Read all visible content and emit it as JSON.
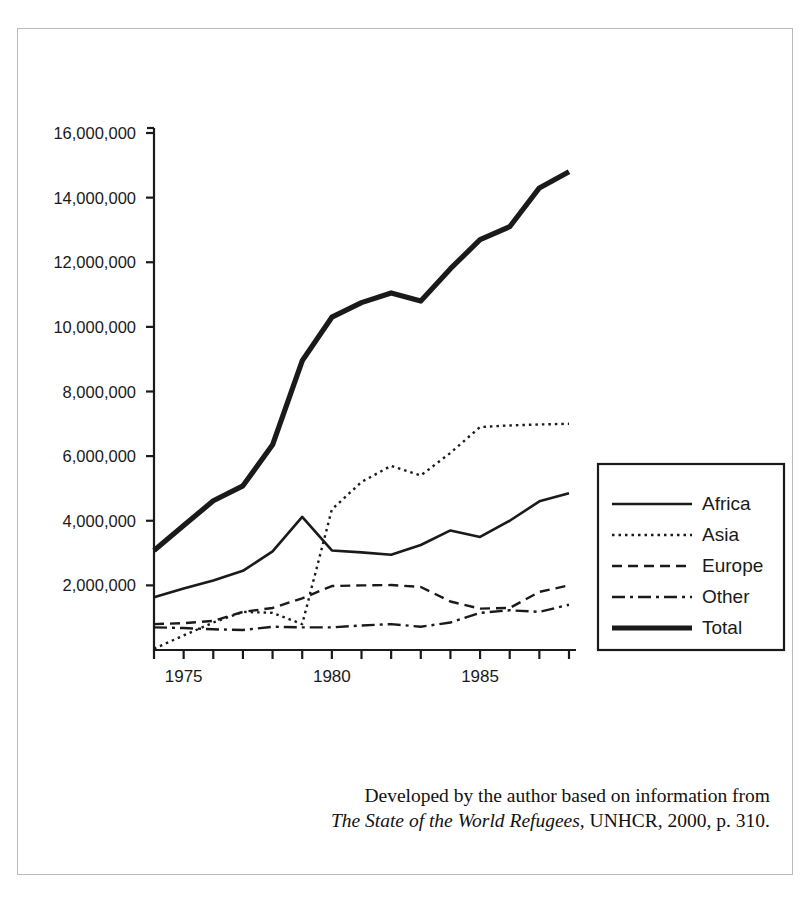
{
  "figure": {
    "caption_line1": "Developed by the author based on information from",
    "caption_title": "The State of the World Refugees",
    "caption_line2_rest": ", UNHCR, 2000, p. 310."
  },
  "legend": {
    "items": [
      {
        "label": "Africa",
        "style": "solid-thin"
      },
      {
        "label": "Asia",
        "style": "dotted"
      },
      {
        "label": "Europe",
        "style": "dashed"
      },
      {
        "label": "Other",
        "style": "dash-dot"
      },
      {
        "label": "Total",
        "style": "solid-thick"
      }
    ]
  },
  "chart_data": {
    "type": "line",
    "title": "",
    "xlabel": "",
    "ylabel": "",
    "xlim": [
      1974,
      1988
    ],
    "ylim": [
      0,
      16000000
    ],
    "grid": false,
    "legend_position": "right",
    "x": [
      1974,
      1975,
      1976,
      1977,
      1978,
      1979,
      1980,
      1981,
      1982,
      1983,
      1984,
      1985,
      1986,
      1987,
      1988
    ],
    "xticks": [
      1974,
      1975,
      1976,
      1977,
      1978,
      1979,
      1980,
      1981,
      1982,
      1983,
      1984,
      1985,
      1986,
      1987,
      1988
    ],
    "xtick_labels_shown": [
      "1975",
      "1980",
      "1985"
    ],
    "yticks": [
      2000000,
      4000000,
      6000000,
      8000000,
      10000000,
      12000000,
      14000000,
      16000000
    ],
    "ytick_labels": [
      "2,000,000",
      "4,000,000",
      "6,000,000",
      "8,000,000",
      "10,000,000",
      "12,000,000",
      "14,000,000",
      "16,000,000"
    ],
    "series": [
      {
        "name": "Africa",
        "style": "solid-thin",
        "values": [
          1630000,
          1900000,
          2150000,
          2450000,
          3050000,
          4120000,
          3080000,
          3020000,
          2950000,
          3250000,
          3700000,
          3500000,
          4000000,
          4600000,
          4850000
        ]
      },
      {
        "name": "Asia",
        "style": "dotted",
        "values": [
          40000,
          450000,
          850000,
          1180000,
          1150000,
          800000,
          4350000,
          5200000,
          5700000,
          5400000,
          6100000,
          6900000,
          6950000,
          6980000,
          7000000
        ]
      },
      {
        "name": "Europe",
        "style": "dashed",
        "values": [
          800000,
          830000,
          900000,
          1180000,
          1300000,
          1600000,
          1980000,
          2000000,
          2010000,
          1950000,
          1500000,
          1280000,
          1300000,
          1800000,
          2000000
        ]
      },
      {
        "name": "Other",
        "style": "dash-dot",
        "values": [
          700000,
          680000,
          640000,
          620000,
          720000,
          700000,
          700000,
          760000,
          800000,
          720000,
          850000,
          1150000,
          1230000,
          1180000,
          1400000
        ]
      },
      {
        "name": "Total",
        "style": "solid-thick",
        "values": [
          3080000,
          3850000,
          4620000,
          5080000,
          6350000,
          8950000,
          10300000,
          10750000,
          11050000,
          10800000,
          11800000,
          12700000,
          13100000,
          14300000,
          14800000
        ]
      }
    ]
  }
}
